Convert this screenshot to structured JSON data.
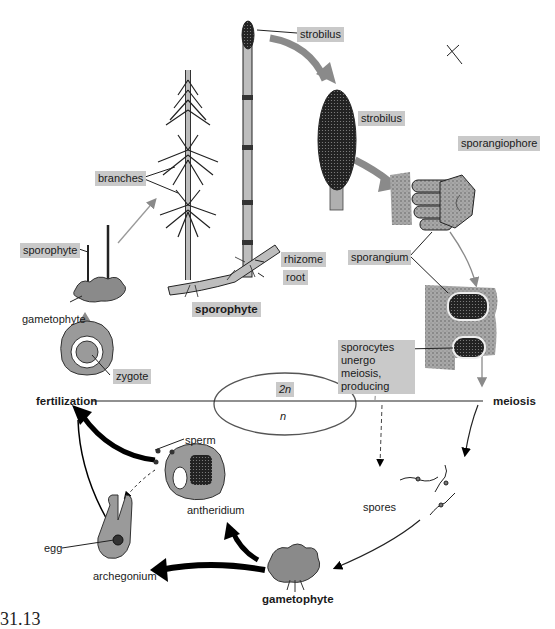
{
  "figure_number": "31.13",
  "colors": {
    "label_bg": "#c9c9c9",
    "arrow_gray": "#8a8a8a",
    "arrow_black": "#000000",
    "tissue_gray": "#9a9a9a",
    "text": "#1a1a1a"
  },
  "ploidy": {
    "diploid": "2n",
    "haploid": "n"
  },
  "stages": {
    "fertilization": "fertilization",
    "meiosis": "meiosis",
    "sporophyte": "sporophyte",
    "gametophyte": "gametophyte"
  },
  "labels": {
    "strobilus_top": "strobilus",
    "strobilus_enlarged": "strobilus",
    "branches": "branches",
    "sporangiophore": "sporangiophore",
    "sporangium": "sporangium",
    "rhizome": "rhizome",
    "root": "root",
    "young_sporophyte": "sporophyte",
    "young_gametophyte": "gametophyte",
    "zygote": "zygote",
    "sporocytes": "sporocytes\nunergo meiosis,\nproducing",
    "spores": "spores",
    "sperm": "sperm",
    "antheridium": "antheridium",
    "egg": "egg",
    "archegonium": "archegonium"
  }
}
